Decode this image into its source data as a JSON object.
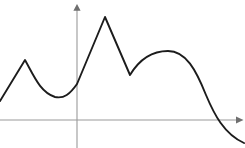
{
  "chart_data": {
    "type": "line",
    "title": "",
    "subtitle": "",
    "xlabel": "",
    "ylabel": "",
    "grid": false,
    "legend": false,
    "legend_position": "none",
    "axis_style": "arrow-ended cartesian axes through origin",
    "origin_px": {
      "x": 77,
      "y": 120
    },
    "xlim_px": [
      0,
      245
    ],
    "ylim_px": [
      0,
      148
    ],
    "x_axis": {
      "name": "x-axis",
      "start_px": {
        "x": 0,
        "y": 120
      },
      "end_px": {
        "x": 240,
        "y": 120
      },
      "arrow": "right",
      "color": "#9a9a9a",
      "tick_labels": []
    },
    "y_axis": {
      "name": "y-axis",
      "start_px": {
        "x": 77,
        "y": 148
      },
      "end_px": {
        "x": 77,
        "y": 4
      },
      "arrow": "up",
      "color": "#9a9a9a",
      "tick_labels": []
    },
    "series": [
      {
        "name": "hand-drawn curve",
        "color": "#1c1c1c",
        "stroke_width": 1.9,
        "points_px": [
          {
            "x": 0,
            "y": 101,
            "feature": "left-edge-start"
          },
          {
            "x": 25,
            "y": 60,
            "feature": "local-maximum-small-peak"
          },
          {
            "x": 55,
            "y": 97,
            "feature": "local-minimum-valley"
          },
          {
            "x": 77,
            "y": 84,
            "feature": "y-axis-crossing"
          },
          {
            "x": 105,
            "y": 17,
            "feature": "global-maximum-sharp-peak"
          },
          {
            "x": 130,
            "y": 75,
            "feature": "local-minimum-v-notch"
          },
          {
            "x": 168,
            "y": 51,
            "feature": "local-maximum-rounded-hump"
          },
          {
            "x": 218,
            "y": 120,
            "feature": "x-axis-crossing"
          },
          {
            "x": 244,
            "y": 143,
            "feature": "right-edge-end"
          }
        ],
        "path_d": "M 0,101 L 25,60 C 34,76 40,92 55,97 C 64,99 70,94 77,84 L 105,17 L 130,75 C 139,60 152,51 168,51 C 186,51 196,70 206,95 C 214,114 224,134 244,143",
        "description": "A smooth piecewise curve: rises from the left edge to a small sharp peak, dips into a rounded valley, climbs steeply through the y-axis to a tall sharp global maximum, drops into a sharp V notch, rises into a broad rounded hump, then descends steeply crossing the x-axis and flattens toward the bottom-right."
      }
    ]
  }
}
